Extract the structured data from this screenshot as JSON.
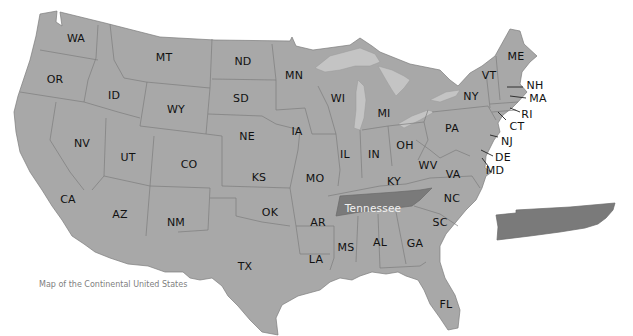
{
  "map": {
    "title": "Map of the Continental United States",
    "highlighted_state": {
      "name": "Tennessee",
      "label": "Tennessee",
      "color": "#7a7a7a"
    },
    "colors": {
      "state_fill": "#a8a8a8",
      "state_border": "#7d7d7d",
      "highlight_fill": "#7a7a7a",
      "lake_fill": "#c4c4c4",
      "background": "#ffffff"
    },
    "states": [
      {
        "abbr": "WA",
        "x": 76,
        "y": 38
      },
      {
        "abbr": "OR",
        "x": 55,
        "y": 79
      },
      {
        "abbr": "ID",
        "x": 114,
        "y": 95
      },
      {
        "abbr": "MT",
        "x": 164,
        "y": 57
      },
      {
        "abbr": "WY",
        "x": 176,
        "y": 109
      },
      {
        "abbr": "ND",
        "x": 243,
        "y": 61
      },
      {
        "abbr": "SD",
        "x": 241,
        "y": 98
      },
      {
        "abbr": "MN",
        "x": 294,
        "y": 75
      },
      {
        "abbr": "NE",
        "x": 247,
        "y": 136
      },
      {
        "abbr": "IA",
        "x": 297,
        "y": 131
      },
      {
        "abbr": "NV",
        "x": 82,
        "y": 143
      },
      {
        "abbr": "UT",
        "x": 128,
        "y": 157
      },
      {
        "abbr": "CO",
        "x": 189,
        "y": 164
      },
      {
        "abbr": "KS",
        "x": 259,
        "y": 177
      },
      {
        "abbr": "MO",
        "x": 315,
        "y": 178
      },
      {
        "abbr": "CA",
        "x": 68,
        "y": 199
      },
      {
        "abbr": "AZ",
        "x": 120,
        "y": 214
      },
      {
        "abbr": "NM",
        "x": 176,
        "y": 222
      },
      {
        "abbr": "OK",
        "x": 270,
        "y": 212
      },
      {
        "abbr": "TX",
        "x": 245,
        "y": 266
      },
      {
        "abbr": "AR",
        "x": 318,
        "y": 222
      },
      {
        "abbr": "LA",
        "x": 316,
        "y": 259
      },
      {
        "abbr": "MS",
        "x": 346,
        "y": 247
      },
      {
        "abbr": "AL",
        "x": 380,
        "y": 242
      },
      {
        "abbr": "GA",
        "x": 415,
        "y": 243
      },
      {
        "abbr": "FL",
        "x": 446,
        "y": 304
      },
      {
        "abbr": "SC",
        "x": 440,
        "y": 222
      },
      {
        "abbr": "NC",
        "x": 452,
        "y": 198
      },
      {
        "abbr": "WI",
        "x": 338,
        "y": 98
      },
      {
        "abbr": "MI",
        "x": 384,
        "y": 113
      },
      {
        "abbr": "IL",
        "x": 345,
        "y": 154
      },
      {
        "abbr": "IN",
        "x": 374,
        "y": 154
      },
      {
        "abbr": "OH",
        "x": 405,
        "y": 145
      },
      {
        "abbr": "KY",
        "x": 394,
        "y": 181
      },
      {
        "abbr": "WV",
        "x": 428,
        "y": 165
      },
      {
        "abbr": "VA",
        "x": 453,
        "y": 174
      },
      {
        "abbr": "PA",
        "x": 452,
        "y": 128
      },
      {
        "abbr": "NY",
        "x": 471,
        "y": 96
      },
      {
        "abbr": "VT",
        "x": 489,
        "y": 75
      },
      {
        "abbr": "ME",
        "x": 516,
        "y": 56
      },
      {
        "abbr": "NH",
        "x": 535,
        "y": 85
      },
      {
        "abbr": "MA",
        "x": 538,
        "y": 98
      },
      {
        "abbr": "RI",
        "x": 527,
        "y": 114
      },
      {
        "abbr": "CT",
        "x": 517,
        "y": 126
      },
      {
        "abbr": "NJ",
        "x": 507,
        "y": 141
      },
      {
        "abbr": "DE",
        "x": 503,
        "y": 157
      },
      {
        "abbr": "MD",
        "x": 495,
        "y": 170
      }
    ]
  }
}
